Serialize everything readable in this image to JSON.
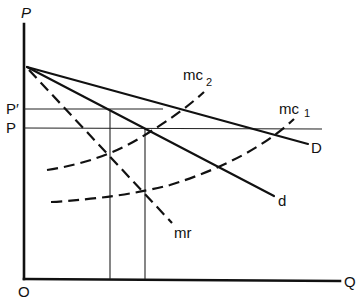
{
  "diagram": {
    "type": "economics price-quantity diagram",
    "axes": {
      "y_label": "P",
      "x_label": "Q",
      "origin_label": "O"
    },
    "price_levels": [
      {
        "label": "P′",
        "name": "P-prime"
      },
      {
        "label": "P",
        "name": "P"
      }
    ],
    "curves": [
      {
        "id": "D",
        "label": "D",
        "style": "solid",
        "description": "market demand curve"
      },
      {
        "id": "d",
        "label": "d",
        "style": "solid",
        "description": "firm demand curve"
      },
      {
        "id": "mr",
        "label": "mr",
        "style": "dashed",
        "description": "marginal revenue"
      },
      {
        "id": "mc2",
        "label": "mc",
        "subscript": "2",
        "style": "dashed",
        "description": "marginal cost 2"
      },
      {
        "id": "mc1",
        "label": "mc",
        "subscript": "1",
        "style": "dashed",
        "description": "marginal cost 1"
      }
    ],
    "quantity_markers": 2
  },
  "colors": {
    "ink": "#111111",
    "background": "#ffffff"
  }
}
